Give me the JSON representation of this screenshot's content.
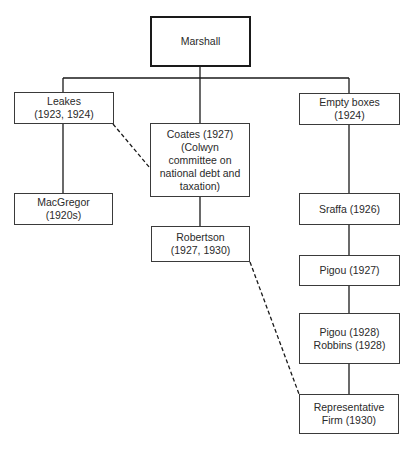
{
  "diagram": {
    "type": "tree",
    "root": {
      "label": "Marshall"
    },
    "nodes": {
      "leakes": {
        "label": "Leakes\n(1923, 1924)"
      },
      "macgregor": {
        "label": "MacGregor (1920s)"
      },
      "coates": {
        "label": "Coates (1927)\n(Colwyn\ncommittee on\nnational debt and\ntaxation)"
      },
      "robertson": {
        "label": "Robertson\n(1927, 1930)"
      },
      "empty_boxes": {
        "label": "Empty boxes\n(1924)"
      },
      "sraffa": {
        "label": "Sraffa (1926)"
      },
      "pigou_1927": {
        "label": "Pigou (1927)"
      },
      "pigou_robbins_1928": {
        "label": "Pigou (1928)\nRobbins (1928)"
      },
      "representative_firm": {
        "label": "Representative\nFirm (1930)"
      }
    },
    "edges": [
      {
        "from": "Marshall",
        "to": "Leakes (1923, 1924)",
        "style": "solid"
      },
      {
        "from": "Marshall",
        "to": "Coates (1927)",
        "style": "solid"
      },
      {
        "from": "Marshall",
        "to": "Empty boxes (1924)",
        "style": "solid"
      },
      {
        "from": "Leakes (1923, 1924)",
        "to": "MacGregor (1920s)",
        "style": "solid"
      },
      {
        "from": "Coates (1927)",
        "to": "Robertson (1927, 1930)",
        "style": "solid"
      },
      {
        "from": "Empty boxes (1924)",
        "to": "Sraffa (1926)",
        "style": "solid"
      },
      {
        "from": "Sraffa (1926)",
        "to": "Pigou (1927)",
        "style": "solid"
      },
      {
        "from": "Pigou (1927)",
        "to": "Pigou (1928) Robbins (1928)",
        "style": "solid"
      },
      {
        "from": "Pigou (1928) Robbins (1928)",
        "to": "Representative Firm (1930)",
        "style": "solid"
      },
      {
        "from": "Leakes (1923, 1924)",
        "to": "Coates (1927)",
        "style": "dashed"
      },
      {
        "from": "Robertson (1927, 1930)",
        "to": "Representative Firm (1930)",
        "style": "dashed"
      }
    ],
    "colors": {
      "line": "#1a1a1a",
      "box_border": "#3a3a3a",
      "text": "#2a2a2a",
      "background": "#ffffff"
    }
  }
}
